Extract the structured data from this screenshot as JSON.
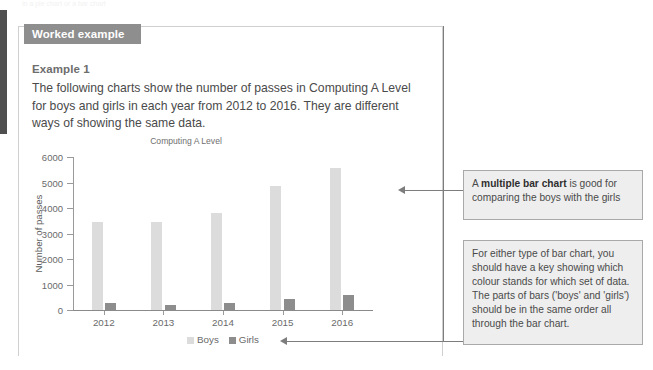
{
  "page": {
    "top_cut_text": "in a pie chart or a bar chart"
  },
  "worked_example": {
    "banner_label": "Worked example",
    "example_label": "Example 1",
    "body_text": "The following charts show the number of passes in Computing A Level for boys and girls in each year from 2012 to 2016. They are different ways of showing the same data."
  },
  "chart_data": {
    "type": "bar",
    "title": "Computing A Level",
    "xlabel": "",
    "ylabel": "Number of passes",
    "categories": [
      "2012",
      "2013",
      "2014",
      "2015",
      "2016"
    ],
    "series": [
      {
        "name": "Boys",
        "color": "#dcdcdc",
        "values": [
          3450,
          3450,
          3820,
          4870,
          5580
        ]
      },
      {
        "name": "Girls",
        "color": "#8d8d8d",
        "values": [
          270,
          200,
          280,
          420,
          580
        ]
      }
    ],
    "ylim": [
      0,
      6000
    ],
    "yticks": [
      0,
      1000,
      2000,
      3000,
      4000,
      5000,
      6000
    ],
    "ytick_labels": [
      "0",
      "1000",
      "2000",
      "3000",
      "4000",
      "5000",
      "6000"
    ],
    "grid": false,
    "legend_position": "bottom"
  },
  "notes": [
    {
      "id": "note-multiple-bar-chart",
      "prefix": "A ",
      "bold": "multiple bar chart",
      "suffix": " is good for comparing the boys with the girls"
    },
    {
      "id": "note-key-colours",
      "text": "For either type of bar chart, you should have a key showing which colour stands for which set of data. The parts of bars ('boys' and 'girls') should be in the same order all through the bar chart."
    }
  ],
  "colors": {
    "banner_bg": "#8e8e8e",
    "note_bg": "#eeeeee",
    "note_border": "#a9a9a9",
    "connector": "#7d7d7d",
    "boys_bar": "#dcdcdc",
    "girls_bar": "#8d8d8d"
  }
}
